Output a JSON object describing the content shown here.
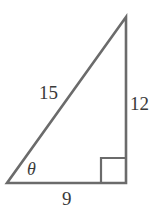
{
  "figure": {
    "type": "right-triangle-diagram",
    "background_color": "#ffffff",
    "stroke_color": "#6b6b6b",
    "text_color": "#3a3a3a",
    "labels": {
      "hypotenuse": "15",
      "vertical_leg": "12",
      "base_leg": "9",
      "angle": "θ"
    },
    "geometry": {
      "vertex_bottom_left": [
        7,
        183
      ],
      "vertex_bottom_right": [
        126,
        183
      ],
      "vertex_top_right": [
        126,
        17
      ],
      "right_angle_marker": {
        "x": 101,
        "y": 158,
        "size": 25
      },
      "stroke_width": 2.6
    }
  }
}
